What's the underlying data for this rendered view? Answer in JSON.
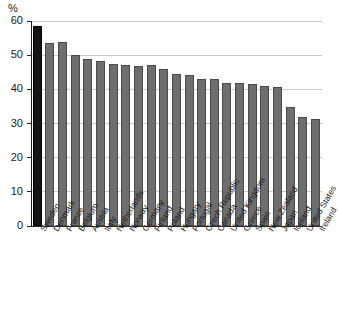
{
  "chart_data": {
    "type": "bar",
    "title": "",
    "subtitle": "",
    "xlabel": "",
    "ylabel": "%",
    "unit": "%",
    "ylim": [
      0,
      60
    ],
    "ytick_step": 10,
    "yticks": [
      0,
      10,
      20,
      30,
      40,
      50,
      60
    ],
    "ytick_labels": [
      "0",
      "10",
      "20",
      "30",
      "40",
      "50",
      "60"
    ],
    "grid": true,
    "legend": "none",
    "categories": [
      "Sweden",
      "Denmark",
      "France",
      "Belgium",
      "Austria",
      "Italy",
      "Netherlands",
      "Norway",
      "Germany",
      "Finland",
      "Poland",
      "Hungary",
      "Portugal",
      "Czech Republic",
      "Canada",
      "United Kingdom",
      "Greece",
      "Spain",
      "New Zealand",
      "Japan",
      "Iceland",
      "United States",
      "Ireland"
    ],
    "values": [
      58.5,
      53.5,
      53.8,
      50.0,
      49.0,
      48.4,
      47.5,
      47.0,
      46.8,
      47.0,
      46.0,
      44.5,
      44.3,
      43.0,
      43.0,
      42.0,
      41.8,
      41.6,
      41.0,
      40.6,
      34.7,
      32.0,
      31.3
    ],
    "highlight_index": 0,
    "colors": {
      "bar": "#6e6e6e",
      "bar_border": "#4a4a4a",
      "highlight_bar": "#141414",
      "highlight_border": "#000000",
      "gridline": "#c9c9c9",
      "axis": "#1f1f1f",
      "text": "#1a1a1a",
      "background": "#ffffff"
    }
  }
}
